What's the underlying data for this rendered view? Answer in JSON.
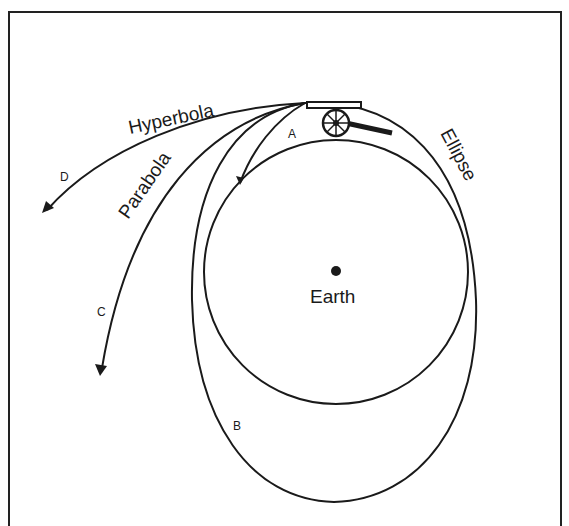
{
  "diagram": {
    "labels": {
      "hyperbola": "Hyperbola",
      "parabola": "Parabola",
      "ellipse": "Ellipse",
      "earth": "Earth",
      "a": "A",
      "b": "B",
      "c": "C",
      "d": "D"
    },
    "colors": {
      "line": "#1a1a1a",
      "background": "#ffffff"
    }
  }
}
